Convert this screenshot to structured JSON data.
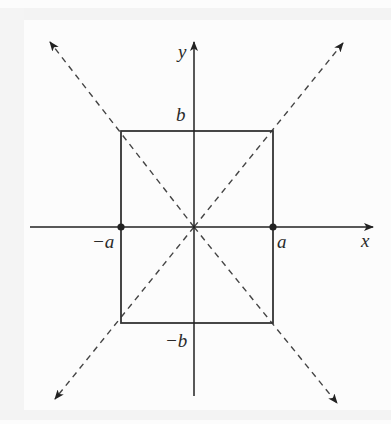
{
  "diagram": {
    "title": "",
    "labels": {
      "x_axis": "x",
      "y_axis": "y",
      "b_top": "b",
      "b_bottom": "−b",
      "a_right": "a",
      "a_left": "−a"
    },
    "colors": {
      "stroke": "#333333",
      "dashed": "#444444",
      "text": "#2a2a2a",
      "background": "#fcfcfc"
    },
    "elements": {
      "rectangle": {
        "x_min": "-a",
        "x_max": "a",
        "y_min": "-b",
        "y_max": "b"
      },
      "points": [
        "(-a, 0)",
        "(a, 0)"
      ],
      "dashed_lines": [
        "y = (b/a)x",
        "y = -(b/a)x"
      ]
    }
  }
}
